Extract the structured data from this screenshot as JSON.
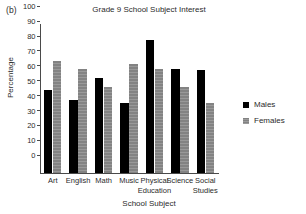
{
  "panel_label": "(b)",
  "legend": {
    "position": "right",
    "entries": [
      {
        "name": "Males",
        "color": "#000000"
      },
      {
        "name": "Females",
        "color": "#8d8d8d"
      }
    ]
  },
  "chart_data": {
    "type": "bar",
    "title": "Grade 9 School Subject Interest",
    "xlabel": "School Subject",
    "ylabel": "Percentage",
    "categories": [
      "Art",
      "English",
      "Math",
      "Music",
      "Physical Education",
      "Science",
      "Social Studies"
    ],
    "category_lines": [
      [
        "Art"
      ],
      [
        "English"
      ],
      [
        "Math"
      ],
      [
        "Music"
      ],
      [
        "Physical",
        "Education"
      ],
      [
        "Science"
      ],
      [
        "Social",
        "Studies"
      ]
    ],
    "series": [
      {
        "name": "Males",
        "color": "#000000",
        "values": [
          56,
          49,
          64,
          47,
          89,
          70,
          69
        ]
      },
      {
        "name": "Females",
        "color": "#8d8d8d",
        "values": [
          75,
          70,
          58,
          73,
          70,
          58,
          47
        ]
      }
    ],
    "ylim": [
      0,
      100
    ],
    "yticks": [
      0,
      10,
      20,
      30,
      40,
      50,
      60,
      70,
      80,
      90,
      100
    ],
    "ytick_labels": [
      "0",
      "10",
      "20",
      "30",
      "40",
      "50",
      "60",
      "70",
      "80",
      "90",
      "100"
    ],
    "grid": false,
    "legend_position": "right"
  }
}
